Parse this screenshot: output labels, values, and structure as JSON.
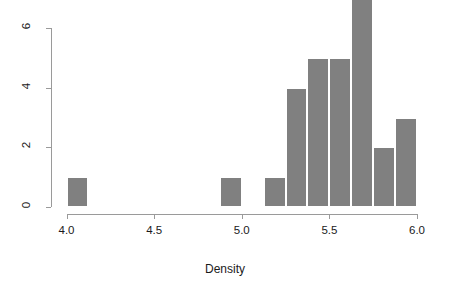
{
  "chart_data": {
    "type": "bar",
    "title": "",
    "subtitle": "",
    "xlabel": "Density",
    "ylabel": "",
    "xlim": [
      3.95,
      5.95
    ],
    "ylim": [
      0,
      7
    ],
    "grid": false,
    "legend": null,
    "bin_width": 0.125,
    "bar_color": "#808080",
    "bar_border_color": "#ffffff",
    "axis_color": "#9a9a9a",
    "text_color": "#1a1a1a",
    "x_ticks": [
      {
        "value": 4.0,
        "label": "4.0"
      },
      {
        "value": 4.5,
        "label": "4.5"
      },
      {
        "value": 5.0,
        "label": "5.0"
      },
      {
        "value": 5.5,
        "label": "5.5"
      },
      {
        "value": 6.0,
        "label": "6.0"
      }
    ],
    "y_ticks": [
      {
        "value": 0,
        "label": "0"
      },
      {
        "value": 2,
        "label": "2"
      },
      {
        "value": 4,
        "label": "4"
      },
      {
        "value": 6,
        "label": "6"
      }
    ],
    "bins": [
      {
        "x0": 4.0,
        "x1": 4.125,
        "count": 1
      },
      {
        "x0": 4.875,
        "x1": 5.0,
        "count": 1
      },
      {
        "x0": 5.125,
        "x1": 5.25,
        "count": 1
      },
      {
        "x0": 5.25,
        "x1": 5.375,
        "count": 4
      },
      {
        "x0": 5.375,
        "x1": 5.5,
        "count": 5
      },
      {
        "x0": 5.5,
        "x1": 5.625,
        "count": 5
      },
      {
        "x0": 5.625,
        "x1": 5.75,
        "count": 7
      },
      {
        "x0": 5.75,
        "x1": 5.875,
        "count": 2
      },
      {
        "x0": 5.875,
        "x1": 6.0,
        "count": 3
      }
    ],
    "categories": [
      "4.000-4.125",
      "4.875-5.000",
      "5.125-5.250",
      "5.250-5.375",
      "5.375-5.500",
      "5.500-5.625",
      "5.625-5.750",
      "5.750-5.875",
      "5.875-6.000"
    ],
    "values": [
      1,
      1,
      1,
      4,
      5,
      5,
      7,
      2,
      3
    ]
  }
}
